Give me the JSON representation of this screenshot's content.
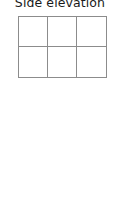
{
  "diagram": {
    "title": "Side elevation",
    "grid": {
      "columns": 3,
      "rows": 2,
      "line_color": "#8c8c8c",
      "cells": [
        {
          "row": 1,
          "col": 1,
          "content": ""
        },
        {
          "row": 1,
          "col": 2,
          "content": ""
        },
        {
          "row": 1,
          "col": 3,
          "content": ""
        },
        {
          "row": 2,
          "col": 1,
          "content": ""
        },
        {
          "row": 2,
          "col": 2,
          "content": ""
        },
        {
          "row": 2,
          "col": 3,
          "content": ""
        }
      ]
    }
  }
}
